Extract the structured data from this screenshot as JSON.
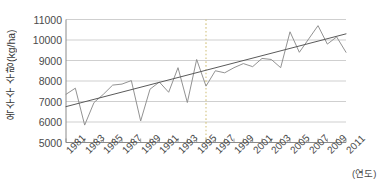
{
  "chart_data": {
    "type": "line",
    "title": "",
    "xlabel": "(연도)",
    "ylabel": "옥수수 수량(kg/ha)",
    "xlim": [
      1981,
      2011
    ],
    "ylim": [
      5000,
      11000
    ],
    "grid": true,
    "legend": "none",
    "ytick_labels": [
      "11000",
      "10000",
      "9000",
      "8000",
      "7000",
      "6000",
      "5000"
    ],
    "ytick_values": [
      11000,
      10000,
      9000,
      8000,
      7000,
      6000,
      5000
    ],
    "xtick_labels": [
      "1981",
      "1983",
      "1985",
      "1987",
      "1989",
      "1991",
      "1993",
      "1995",
      "1997",
      "1999",
      "2001",
      "2003",
      "2005",
      "2007",
      "2009",
      "2011"
    ],
    "xtick_values": [
      1981,
      1983,
      1985,
      1987,
      1989,
      1991,
      1993,
      1995,
      1997,
      1999,
      2001,
      2003,
      2005,
      2007,
      2009,
      2011
    ],
    "series": [
      {
        "name": "옥수수 수량",
        "kind": "line",
        "color": "#8c8c8c",
        "x": [
          1981,
          1982,
          1983,
          1984,
          1985,
          1986,
          1987,
          1988,
          1989,
          1990,
          1991,
          1992,
          1993,
          1994,
          1995,
          1996,
          1997,
          1998,
          1999,
          2000,
          2001,
          2002,
          2003,
          2004,
          2005,
          2006,
          2007,
          2008,
          2009,
          2010,
          2011
        ],
        "values": [
          7350,
          7650,
          5850,
          6950,
          7350,
          7800,
          7850,
          8020,
          6050,
          7600,
          7950,
          7450,
          8650,
          6950,
          9050,
          7750,
          8500,
          8400,
          8650,
          8850,
          8700,
          9100,
          9050,
          8650,
          10400,
          9400,
          10050,
          10700,
          9800,
          10150,
          9400
        ]
      },
      {
        "name": "추세선",
        "kind": "trend",
        "color": "#5a5a5a",
        "x": [
          1981,
          2011
        ],
        "values": [
          6750,
          10300
        ]
      }
    ],
    "annotations": [
      {
        "name": "reference-line",
        "kind": "vertical-dashed",
        "x": 1996,
        "color": "#d8c98a"
      }
    ]
  }
}
